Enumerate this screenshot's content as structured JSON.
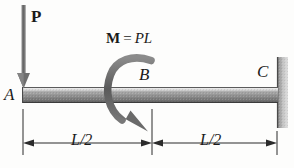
{
  "figure": {
    "type": "free-body-diagram",
    "background_color": "#fdfdfc",
    "ink_color": "#1a1a1a"
  },
  "beam": {
    "label_left": "A",
    "label_mid": "B",
    "label_right": "C",
    "fill_light": "#d8d8d8",
    "fill_dark": "#6e6e6e",
    "edge_color": "#3a3a3a"
  },
  "load": {
    "name": "point-load",
    "label": "P",
    "direction": "down",
    "applied_at": "A",
    "color": "#6b6b6b"
  },
  "moment": {
    "name": "applied-moment",
    "symbol": "M",
    "equals": "=",
    "magnitude": "PL",
    "sense": "counterclockwise",
    "applied_at": "B",
    "color": "#5e5e5e"
  },
  "support": {
    "name": "fixed-wall-support",
    "at": "C",
    "type": "fixed",
    "fill_light": "#cfcfcf",
    "fill_dark": "#8a8a8a"
  },
  "dimensions": [
    {
      "label": "L/2",
      "from": "A",
      "to": "B"
    },
    {
      "label": "L/2",
      "from": "B",
      "to": "C"
    }
  ]
}
